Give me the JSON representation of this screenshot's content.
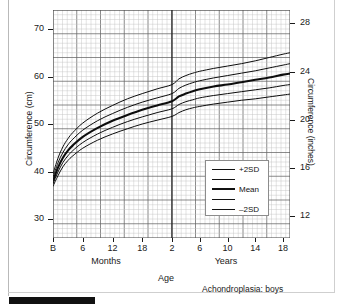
{
  "figure": {
    "caption": "Achondroplasia: boys",
    "age_label": "Age",
    "months_label": "Months",
    "years_label": "Years",
    "y_axis_left_title": "Circumference (cm)",
    "y_axis_right_title": "Circumference (inches)"
  },
  "legend": {
    "title": "",
    "entries": [
      {
        "label": "+2SD",
        "style": "thin"
      },
      {
        "label": "",
        "style": "thin"
      },
      {
        "label": "Mean",
        "style": "thick"
      },
      {
        "label": "",
        "style": "thin"
      },
      {
        "label": "–2SD",
        "style": "thin"
      }
    ]
  },
  "chart_data": {
    "type": "line",
    "title": "Achondroplasia: boys",
    "subtitle": "",
    "xlabel": "Age",
    "ylabel": "Circumference (cm)",
    "y2label": "Circumference (inches)",
    "grid": true,
    "legend_position": "inside-bottom-right",
    "x_axis": {
      "scale_break_at": 2.0,
      "note": "Left segment is in months (Birth to 24 months); right segment is in years (2 to 19 years). The two segments share the panel and are separated by a heavy vertical rule at 2 years.",
      "months_ticks": [
        "B",
        "6",
        "12",
        "18"
      ],
      "months_tick_values": [
        0,
        6,
        12,
        18
      ],
      "years_ticks": [
        "2",
        "6",
        "10",
        "14",
        "18"
      ],
      "years_tick_values": [
        2,
        6,
        10,
        14,
        18
      ],
      "xlim_months": [
        0,
        24
      ],
      "xlim_years": [
        2,
        19
      ]
    },
    "y_axis_left": {
      "ticks": [
        30,
        40,
        50,
        60,
        70
      ],
      "ticklabels": [
        "30",
        "40",
        "50",
        "60",
        "70"
      ],
      "ylim": [
        26,
        74
      ],
      "units": "cm"
    },
    "y_axis_right": {
      "ticks": [
        12,
        16,
        20,
        24,
        28
      ],
      "ticklabels": [
        "12",
        "16",
        "20",
        "24",
        "28"
      ],
      "ylim": [
        10.2,
        29.1
      ],
      "units": "inches"
    },
    "series": [
      {
        "name": "+2SD",
        "style": "thin",
        "x_months": [
          0,
          1,
          2,
          3,
          4,
          6,
          9,
          12,
          15,
          18,
          21,
          24
        ],
        "y_months": [
          39.5,
          42.8,
          45.2,
          46.9,
          48.2,
          50.2,
          52.3,
          53.9,
          55.3,
          56.4,
          57.4,
          58.3
        ],
        "x_years": [
          2,
          3,
          4,
          5,
          6,
          8,
          10,
          12,
          14,
          16,
          18,
          19
        ],
        "y_years": [
          58.3,
          59.5,
          60.2,
          60.7,
          61.1,
          61.7,
          62.2,
          62.7,
          63.3,
          64.0,
          64.7,
          65.0
        ]
      },
      {
        "name": "+1SD",
        "style": "thin",
        "x_months": [
          0,
          1,
          2,
          3,
          4,
          6,
          9,
          12,
          15,
          18,
          21,
          24
        ],
        "y_months": [
          38.8,
          41.8,
          44.0,
          45.6,
          46.8,
          48.7,
          50.7,
          52.2,
          53.5,
          54.6,
          55.5,
          56.4
        ],
        "x_years": [
          2,
          3,
          4,
          5,
          6,
          8,
          10,
          12,
          14,
          16,
          18,
          19
        ],
        "y_years": [
          56.4,
          57.5,
          58.2,
          58.7,
          59.1,
          59.7,
          60.2,
          60.7,
          61.2,
          61.8,
          62.4,
          62.7
        ]
      },
      {
        "name": "Mean",
        "style": "thick",
        "x_months": [
          0,
          1,
          2,
          3,
          4,
          6,
          9,
          12,
          15,
          18,
          21,
          24
        ],
        "y_months": [
          38.0,
          40.8,
          42.9,
          44.4,
          45.5,
          47.3,
          49.2,
          50.7,
          51.9,
          53.0,
          53.9,
          54.8
        ],
        "x_years": [
          2,
          3,
          4,
          5,
          6,
          8,
          10,
          12,
          14,
          16,
          18,
          19
        ],
        "y_years": [
          54.8,
          55.8,
          56.4,
          56.9,
          57.3,
          57.9,
          58.3,
          58.8,
          59.3,
          59.8,
          60.4,
          60.6
        ]
      },
      {
        "name": "-1SD",
        "style": "thin",
        "x_months": [
          0,
          1,
          2,
          3,
          4,
          6,
          9,
          12,
          15,
          18,
          21,
          24
        ],
        "y_months": [
          37.4,
          39.9,
          41.9,
          43.3,
          44.4,
          46.1,
          47.9,
          49.3,
          50.5,
          51.5,
          52.4,
          53.2
        ],
        "x_years": [
          2,
          3,
          4,
          5,
          6,
          8,
          10,
          12,
          14,
          16,
          18,
          19
        ],
        "y_years": [
          53.2,
          54.1,
          54.7,
          55.1,
          55.5,
          56.0,
          56.4,
          56.8,
          57.2,
          57.6,
          58.1,
          58.3
        ]
      },
      {
        "name": "-2SD",
        "style": "thin",
        "x_months": [
          0,
          1,
          2,
          3,
          4,
          6,
          9,
          12,
          15,
          18,
          21,
          24
        ],
        "y_months": [
          36.9,
          39.1,
          41.0,
          42.3,
          43.3,
          44.9,
          46.6,
          47.9,
          49.0,
          50.0,
          50.8,
          51.6
        ],
        "x_years": [
          2,
          3,
          4,
          5,
          6,
          8,
          10,
          12,
          14,
          16,
          18,
          19
        ],
        "y_years": [
          51.6,
          52.4,
          53.0,
          53.4,
          53.7,
          54.2,
          54.6,
          55.0,
          55.3,
          55.7,
          56.1,
          56.3
        ]
      }
    ]
  }
}
